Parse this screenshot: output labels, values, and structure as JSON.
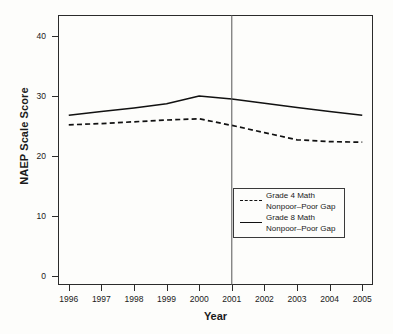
{
  "chart_data": {
    "type": "line",
    "title": "",
    "xlabel": "Year",
    "ylabel": "NAEP Scale Score",
    "x": [
      1996,
      1997,
      1998,
      1999,
      2000,
      2001,
      2002,
      2003,
      2004,
      2005
    ],
    "xtick_labels": [
      "1996",
      "1997",
      "1998",
      "1999",
      "2000",
      "2001",
      "2002",
      "2003",
      "2004",
      "2005"
    ],
    "ytick_labels": [
      "0",
      "10",
      "20",
      "30",
      "40"
    ],
    "yticks": [
      0,
      10,
      20,
      30,
      40
    ],
    "ylim": [
      -1.5,
      43.5
    ],
    "xlim": [
      1995.67,
      2005.33
    ],
    "grid": false,
    "legend_position": "lower right",
    "series": [
      {
        "name": "Grade 4 Math\nNonpoor–Poor Gap",
        "label_line1": "Grade 4 Math",
        "label_line2": "Nonpoor–Poor Gap",
        "style": "dashed",
        "color": "#111111",
        "values": [
          25.2,
          25.4,
          25.7,
          26.0,
          26.2,
          25.1,
          23.9,
          22.7,
          22.4,
          22.3
        ]
      },
      {
        "name": "Grade 8 Math\nNonpoor–Poor Gap",
        "label_line1": "Grade 8 Math",
        "label_line2": "Nonpoor–Poor Gap",
        "style": "solid",
        "color": "#111111",
        "values": [
          26.8,
          27.4,
          28.0,
          28.7,
          30.0,
          29.5,
          28.8,
          28.1,
          27.4,
          26.8
        ]
      }
    ],
    "annotations": [
      {
        "type": "vertical-reference-line",
        "x": 2001,
        "label": "",
        "color": "#555555"
      }
    ]
  },
  "axes": {
    "y_title": "NAEP Scale Score",
    "x_title": "Year"
  },
  "legend": {
    "entries": [
      {
        "key": "dashed",
        "line1": "Grade 4 Math",
        "line2": "Nonpoor–Poor Gap"
      },
      {
        "key": "solid",
        "line1": "Grade 8 Math",
        "line2": "Nonpoor–Poor Gap"
      }
    ]
  }
}
